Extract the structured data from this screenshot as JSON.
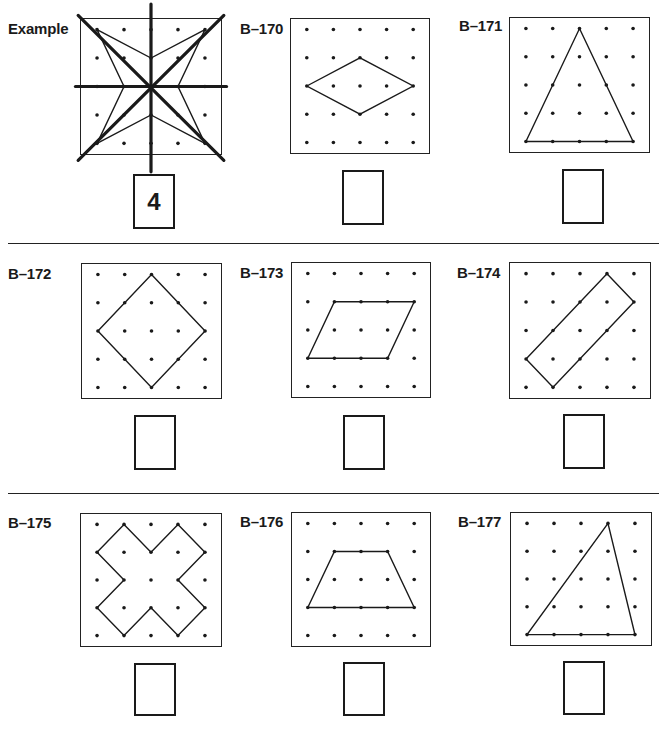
{
  "grid": {
    "rows": 5,
    "cols": 5
  },
  "colors": {
    "ink": "#1a1a1a",
    "paper": "#ffffff"
  },
  "dividers": [
    {
      "y": 243,
      "x1": 8,
      "x2": 659
    },
    {
      "y": 493,
      "x1": 8,
      "x2": 659
    }
  ],
  "problems": [
    {
      "id": "example",
      "label": "Example",
      "answer": "4",
      "label_pos": [
        8,
        20
      ],
      "board": [
        80,
        18,
        142,
        137
      ],
      "answer_box": [
        133,
        174,
        42,
        55
      ],
      "shape": [
        [
          0,
          0
        ],
        [
          2,
          1
        ],
        [
          4,
          0
        ],
        [
          3,
          2
        ],
        [
          4,
          4
        ],
        [
          2,
          3
        ],
        [
          0,
          4
        ],
        [
          1,
          2
        ]
      ],
      "symmetry_lines": [
        [
          [
            -0.7,
            -0.5
          ],
          [
            4.7,
            4.6
          ]
        ],
        [
          [
            4.7,
            -0.5
          ],
          [
            -0.7,
            4.6
          ]
        ],
        [
          [
            -0.8,
            2
          ],
          [
            4.8,
            2
          ]
        ],
        [
          [
            2,
            -0.9
          ],
          [
            2,
            5.0
          ]
        ]
      ]
    },
    {
      "id": "B-170",
      "label": "B–170",
      "answer": "",
      "label_pos": [
        240,
        20
      ],
      "board": [
        290,
        18,
        140,
        136
      ],
      "answer_box": [
        342,
        170,
        42,
        55
      ],
      "shape": [
        [
          0,
          2
        ],
        [
          2,
          1
        ],
        [
          4,
          2
        ],
        [
          2,
          3
        ]
      ]
    },
    {
      "id": "B-171",
      "label": "B–171",
      "answer": "",
      "label_pos": [
        459,
        17
      ],
      "board": [
        509,
        17,
        141,
        136
      ],
      "answer_box": [
        562,
        169,
        42,
        55
      ],
      "shape": [
        [
          2,
          0
        ],
        [
          4,
          4
        ],
        [
          0,
          4
        ]
      ]
    },
    {
      "id": "B-172",
      "label": "B–172",
      "answer": "",
      "label_pos": [
        8,
        265
      ],
      "board": [
        81,
        263,
        141,
        136
      ],
      "answer_box": [
        134,
        415,
        42,
        55
      ],
      "shape": [
        [
          2,
          0
        ],
        [
          4,
          2
        ],
        [
          2,
          4
        ],
        [
          0,
          2
        ]
      ]
    },
    {
      "id": "B-173",
      "label": "B–173",
      "answer": "",
      "label_pos": [
        240,
        264
      ],
      "board": [
        291,
        262,
        140,
        136
      ],
      "answer_box": [
        343,
        415,
        42,
        55
      ],
      "shape": [
        [
          1,
          1
        ],
        [
          4,
          1
        ],
        [
          3,
          3
        ],
        [
          0,
          3
        ]
      ]
    },
    {
      "id": "B-174",
      "label": "B–174",
      "answer": "",
      "label_pos": [
        457,
        264
      ],
      "board": [
        509,
        262,
        142,
        137
      ],
      "answer_box": [
        563,
        414,
        42,
        55
      ],
      "shape": [
        [
          3,
          0
        ],
        [
          4,
          1
        ],
        [
          1,
          4
        ],
        [
          0,
          3
        ]
      ]
    },
    {
      "id": "B-175",
      "label": "B–175",
      "answer": "",
      "label_pos": [
        8,
        514
      ],
      "board": [
        80,
        513,
        142,
        134
      ],
      "answer_box": [
        134,
        663,
        42,
        53
      ],
      "shape": [
        [
          1,
          0
        ],
        [
          2,
          1
        ],
        [
          3,
          0
        ],
        [
          4,
          1
        ],
        [
          3,
          2
        ],
        [
          4,
          3
        ],
        [
          3,
          4
        ],
        [
          2,
          3
        ],
        [
          1,
          4
        ],
        [
          0,
          3
        ],
        [
          1,
          2
        ],
        [
          0,
          1
        ]
      ]
    },
    {
      "id": "B-176",
      "label": "B–176",
      "answer": "",
      "label_pos": [
        240,
        513
      ],
      "board": [
        291,
        512,
        140,
        135
      ],
      "answer_box": [
        343,
        662,
        42,
        54
      ],
      "shape": [
        [
          1,
          1
        ],
        [
          3,
          1
        ],
        [
          4,
          3
        ],
        [
          0,
          3
        ]
      ]
    },
    {
      "id": "B-177",
      "label": "B–177",
      "answer": "",
      "label_pos": [
        458,
        513
      ],
      "board": [
        510,
        512,
        142,
        134
      ],
      "answer_box": [
        563,
        661,
        42,
        54
      ],
      "shape": [
        [
          3,
          0
        ],
        [
          4,
          4
        ],
        [
          0,
          4
        ]
      ]
    }
  ]
}
